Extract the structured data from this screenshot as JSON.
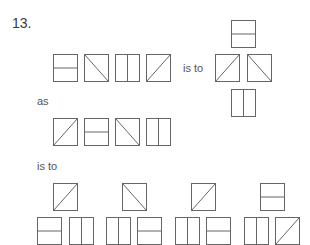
{
  "question": {
    "number": "13.",
    "connectors": {
      "is_to_1": "is to",
      "as": "as",
      "is_to_2": "is to"
    },
    "stroke_color": "#666666",
    "row1": [
      {
        "type": "horizontal",
        "x": 53,
        "y": 54
      },
      {
        "type": "diag-down",
        "x": 84,
        "y": 54
      },
      {
        "type": "vertical",
        "x": 115,
        "y": 54
      },
      {
        "type": "diag-up",
        "x": 146,
        "y": 54
      }
    ],
    "cross1": [
      {
        "pos": "top",
        "type": "horizontal",
        "x": 231,
        "y": 20
      },
      {
        "pos": "left",
        "type": "diag-up",
        "x": 215,
        "y": 54
      },
      {
        "pos": "right",
        "type": "diag-down",
        "x": 247,
        "y": 54
      },
      {
        "pos": "bottom",
        "type": "vertical",
        "x": 231,
        "y": 89
      }
    ],
    "row2": [
      {
        "type": "diag-up",
        "x": 53,
        "y": 118
      },
      {
        "type": "horizontal",
        "x": 84,
        "y": 118
      },
      {
        "type": "diag-down",
        "x": 115,
        "y": 118
      },
      {
        "type": "vertical",
        "x": 146,
        "y": 118
      }
    ],
    "options": [
      {
        "top": {
          "type": "diag-up",
          "x": 53,
          "y": 183
        },
        "bottom_left": {
          "type": "horizontal",
          "x": 37,
          "y": 217
        },
        "bottom_right": {
          "type": "vertical",
          "x": 69,
          "y": 217
        }
      },
      {
        "top": {
          "type": "diag-down",
          "x": 122,
          "y": 183
        },
        "bottom_left": {
          "type": "vertical",
          "x": 106,
          "y": 217
        },
        "bottom_right": {
          "type": "horizontal",
          "x": 137,
          "y": 217
        }
      },
      {
        "top": {
          "type": "diag-up",
          "x": 191,
          "y": 183
        },
        "bottom_left": {
          "type": "vertical",
          "x": 175,
          "y": 217
        },
        "bottom_right": {
          "type": "horizontal",
          "x": 206,
          "y": 217
        }
      },
      {
        "top": {
          "type": "horizontal",
          "x": 260,
          "y": 183
        },
        "bottom_left": {
          "type": "vertical",
          "x": 244,
          "y": 217
        },
        "bottom_right": {
          "type": "diag-up",
          "x": 275,
          "y": 217
        }
      }
    ]
  }
}
